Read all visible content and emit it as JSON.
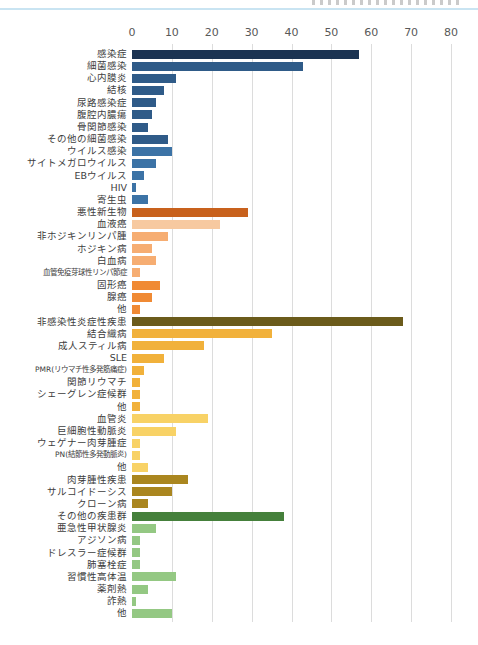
{
  "header": {
    "top_rule_color": "#c9e4f2"
  },
  "chart_data": {
    "type": "bar",
    "orientation": "horizontal",
    "title": "",
    "xlabel": "",
    "ylabel": "",
    "xlim": [
      0,
      80
    ],
    "ticks": [
      0,
      10,
      20,
      30,
      40,
      50,
      60,
      70,
      80
    ],
    "grid": true,
    "palette": {
      "infection-total": "#1b3352",
      "bacterial": "#2f5b88",
      "viral": "#3c73a6",
      "malignancy-total": "#c8611d",
      "blood-cancer": "#f7c9a0",
      "blood-cancer-sub": "#f6ad72",
      "solid-cancer": "#f08a34",
      "inflammatory-total": "#6b5b1b",
      "connective": "#f1b13b",
      "vasculitis": "#f8d266",
      "granulomatous": "#aa861f",
      "other-total": "#45803b",
      "other-sub": "#94c883"
    },
    "bars": [
      {
        "label": "感染症",
        "value": 57,
        "group": "infection-total",
        "small": false
      },
      {
        "label": "細菌感染",
        "value": 43,
        "group": "bacterial",
        "small": false
      },
      {
        "label": "心内膜炎",
        "value": 11,
        "group": "bacterial",
        "small": false
      },
      {
        "label": "結核",
        "value": 8,
        "group": "bacterial",
        "small": false
      },
      {
        "label": "尿路感染症",
        "value": 6,
        "group": "bacterial",
        "small": false
      },
      {
        "label": "腹腔内膿瘍",
        "value": 5,
        "group": "bacterial",
        "small": false
      },
      {
        "label": "骨関節感染",
        "value": 4,
        "group": "bacterial",
        "small": false
      },
      {
        "label": "その他の細菌感染",
        "value": 9,
        "group": "bacterial",
        "small": false
      },
      {
        "label": "ウイルス感染",
        "value": 10,
        "group": "viral",
        "small": false
      },
      {
        "label": "サイトメガロウイルス",
        "value": 6,
        "group": "viral",
        "small": false
      },
      {
        "label": "EBウイルス",
        "value": 3,
        "group": "viral",
        "small": false
      },
      {
        "label": "HIV",
        "value": 1,
        "group": "viral",
        "small": false
      },
      {
        "label": "寄生虫",
        "value": 4,
        "group": "viral",
        "small": false
      },
      {
        "label": "悪性新生物",
        "value": 29,
        "group": "malignancy-total",
        "small": false
      },
      {
        "label": "血液癌",
        "value": 22,
        "group": "blood-cancer",
        "small": false
      },
      {
        "label": "非ホジキンリンパ腫",
        "value": 9,
        "group": "blood-cancer-sub",
        "small": false
      },
      {
        "label": "ホジキン病",
        "value": 5,
        "group": "blood-cancer-sub",
        "small": false
      },
      {
        "label": "白血病",
        "value": 6,
        "group": "blood-cancer-sub",
        "small": false
      },
      {
        "label": "血管免疫芽球性リンパ節症",
        "value": 2,
        "group": "blood-cancer-sub",
        "small": true
      },
      {
        "label": "固形癌",
        "value": 7,
        "group": "solid-cancer",
        "small": false
      },
      {
        "label": "腺癌",
        "value": 5,
        "group": "solid-cancer",
        "small": false
      },
      {
        "label": "他",
        "value": 2,
        "group": "solid-cancer",
        "small": false
      },
      {
        "label": "非感染性炎症性疾患",
        "value": 68,
        "group": "inflammatory-total",
        "small": false
      },
      {
        "label": "結合織病",
        "value": 35,
        "group": "connective",
        "small": false
      },
      {
        "label": "成人スティル病",
        "value": 18,
        "group": "connective",
        "small": false
      },
      {
        "label": "SLE",
        "value": 8,
        "group": "connective",
        "small": false
      },
      {
        "label": "PMR(リウマチ性多発筋痛症)",
        "value": 3,
        "group": "connective",
        "small": true
      },
      {
        "label": "関節リウマチ",
        "value": 2,
        "group": "connective",
        "small": false
      },
      {
        "label": "シェーグレン症候群",
        "value": 2,
        "group": "connective",
        "small": false
      },
      {
        "label": "他",
        "value": 2,
        "group": "connective",
        "small": false
      },
      {
        "label": "血管炎",
        "value": 19,
        "group": "vasculitis",
        "small": false
      },
      {
        "label": "巨細胞性動脈炎",
        "value": 11,
        "group": "vasculitis",
        "small": false
      },
      {
        "label": "ウェゲナー肉芽腫症",
        "value": 2,
        "group": "vasculitis",
        "small": false
      },
      {
        "label": "PN(結節性多発動脈炎)",
        "value": 2,
        "group": "vasculitis",
        "small": true
      },
      {
        "label": "他",
        "value": 4,
        "group": "vasculitis",
        "small": false
      },
      {
        "label": "肉芽腫性疾患",
        "value": 14,
        "group": "granulomatous",
        "small": false
      },
      {
        "label": "サルコイドーシス",
        "value": 10,
        "group": "granulomatous",
        "small": false
      },
      {
        "label": "クローン病",
        "value": 4,
        "group": "granulomatous",
        "small": false
      },
      {
        "label": "その他の疾患群",
        "value": 38,
        "group": "other-total",
        "small": false
      },
      {
        "label": "亜急性甲状腺炎",
        "value": 6,
        "group": "other-sub",
        "small": false
      },
      {
        "label": "アジソン病",
        "value": 2,
        "group": "other-sub",
        "small": false
      },
      {
        "label": "ドレスラー症候群",
        "value": 2,
        "group": "other-sub",
        "small": false
      },
      {
        "label": "肺塞栓症",
        "value": 2,
        "group": "other-sub",
        "small": false
      },
      {
        "label": "習慣性高体温",
        "value": 11,
        "group": "other-sub",
        "small": false
      },
      {
        "label": "薬剤熱",
        "value": 4,
        "group": "other-sub",
        "small": false
      },
      {
        "label": "詐熱",
        "value": 1,
        "group": "other-sub",
        "small": false
      },
      {
        "label": "他",
        "value": 10,
        "group": "other-sub",
        "small": false
      }
    ]
  }
}
